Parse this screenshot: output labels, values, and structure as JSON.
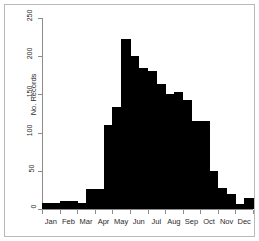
{
  "chart_data": {
    "type": "bar",
    "title": "",
    "subtitle": "",
    "xlabel": "",
    "ylabel": "No. Records",
    "ylim": [
      0,
      250
    ],
    "grid": false,
    "legend": null,
    "y_ticks": [
      0,
      50,
      100,
      150,
      200,
      250
    ],
    "x_tick_labels": [
      "Jan",
      "Feb",
      "Mar",
      "Apr",
      "May",
      "Jun",
      "Jul",
      "Aug",
      "Sep",
      "Oct",
      "Nov",
      "Dec"
    ],
    "bar_color": "#000000",
    "note": "Histogram of records binned by half-month; 24 bins across the year.",
    "categories": [
      "Jan-1",
      "Jan-2",
      "Feb-1",
      "Feb-2",
      "Mar-1",
      "Mar-2",
      "Apr-1",
      "Apr-2",
      "May-1",
      "May-2",
      "Jun-1",
      "Jun-2",
      "Jul-1",
      "Jul-2",
      "Aug-1",
      "Aug-2",
      "Sep-1",
      "Sep-2",
      "Oct-1",
      "Oct-2",
      "Nov-1",
      "Nov-2",
      "Dec-1",
      "Dec-2"
    ],
    "values": [
      8,
      8,
      10,
      10,
      8,
      26,
      26,
      110,
      133,
      222,
      200,
      185,
      180,
      163,
      150,
      153,
      143,
      115,
      115,
      50,
      28,
      20,
      7,
      14
    ]
  },
  "axis": {
    "y_title": "No. Records",
    "y_labels": [
      "0",
      "50",
      "100",
      "150",
      "200",
      "250"
    ],
    "x_labels": [
      "Jan",
      "Feb",
      "Mar",
      "Apr",
      "May",
      "Jun",
      "Jul",
      "Aug",
      "Sep",
      "Oct",
      "Nov",
      "Dec"
    ]
  }
}
